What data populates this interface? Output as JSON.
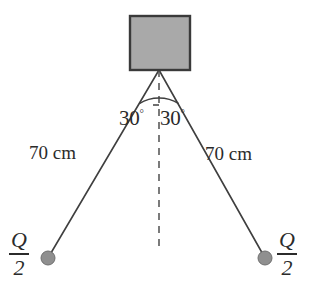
{
  "diagram": {
    "colors": {
      "block_fill": "#a9a9a9",
      "block_stroke": "#3a3a3a",
      "string": "#3f3f3f",
      "dashed_line": "#5a5a5a",
      "ball_fill": "#8f8f8f",
      "ball_stroke": "#6f6f6f",
      "text": "#2b2b2b",
      "background": "#ffffff"
    },
    "block": {
      "name": "support block",
      "x": 130,
      "y": 16,
      "width": 60,
      "height": 54
    },
    "pivot": {
      "x": 159,
      "y": 70
    },
    "vertical_reference": {
      "label": "vertical dashed reference line",
      "x": 159,
      "y_start": 70,
      "y_end": 251,
      "style": "dashed"
    },
    "angles": [
      {
        "id": "left",
        "value": "30",
        "degree_symbol": "°",
        "text": "30°"
      },
      {
        "id": "right",
        "value": "30",
        "degree_symbol": "°",
        "text": "30°"
      }
    ],
    "arc": {
      "label": "angle arc spanning both strings",
      "radius": 38
    },
    "strings": [
      {
        "id": "left",
        "length_label": "70 cm",
        "from": {
          "x": 159,
          "y": 70
        },
        "to": {
          "x": 48,
          "y": 258
        }
      },
      {
        "id": "right",
        "length_label": "70 cm",
        "from": {
          "x": 159,
          "y": 70
        },
        "to": {
          "x": 265,
          "y": 258
        }
      }
    ],
    "charges": [
      {
        "id": "left",
        "numerator": "Q",
        "denominator": "2",
        "text": "Q/2",
        "ball": {
          "cx": 48,
          "cy": 258,
          "r": 7
        }
      },
      {
        "id": "right",
        "numerator": "Q",
        "denominator": "2",
        "text": "Q/2",
        "ball": {
          "cx": 265,
          "cy": 258,
          "r": 7
        }
      }
    ]
  }
}
